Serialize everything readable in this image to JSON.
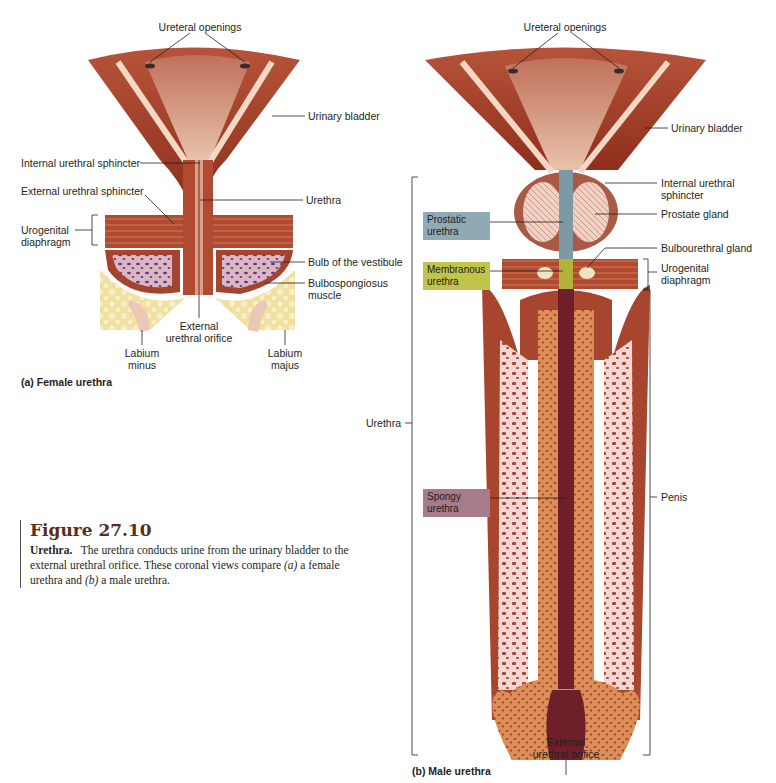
{
  "figure": {
    "number": "Figure 27.10",
    "caption_lead": "Urethra.",
    "caption_text_1": "The urethra conducts urine from the urinary bladder to the external urethral orifice. These coronal views compare ",
    "caption_a": "(a)",
    "caption_text_2": " a female urethra and ",
    "caption_b": "(b)",
    "caption_text_3": " a male urethra."
  },
  "female": {
    "title": "(a) Female urethra",
    "labels": {
      "ureteral_openings": "Ureteral openings",
      "urinary_bladder": "Urinary bladder",
      "internal_sphincter": "Internal urethral sphincter",
      "external_sphincter": "External urethral sphincter",
      "urethra": "Urethra",
      "urogenital_diaphragm_1": "Urogenital",
      "urogenital_diaphragm_2": "diaphragm",
      "bulb_vestibule": "Bulb of the vestibule",
      "bulbospongiosus_1": "Bulbospongiosus",
      "bulbospongiosus_2": "muscle",
      "external_orifice_1": "External",
      "external_orifice_2": "urethral orifice",
      "labium_minus_1": "Labium",
      "labium_minus_2": "minus",
      "labium_majus_1": "Labium",
      "labium_majus_2": "majus"
    }
  },
  "male": {
    "title": "(b) Male urethra",
    "labels": {
      "ureteral_openings": "Ureteral openings",
      "urinary_bladder": "Urinary bladder",
      "internal_sphincter_1": "Internal urethral",
      "internal_sphincter_2": "sphincter",
      "prostate_gland": "Prostate gland",
      "bulbourethral_gland": "Bulbourethral gland",
      "urogenital_diaphragm_1": "Urogenital",
      "urogenital_diaphragm_2": "diaphragm",
      "urethra": "Urethra",
      "penis": "Penis",
      "external_orifice_1": "External",
      "external_orifice_2": "urethral orifice"
    },
    "segments": [
      {
        "line1": "Prostatic",
        "line2": "urethra",
        "color": "#8fa9b5"
      },
      {
        "line1": "Membranous",
        "line2": "urethra",
        "color": "#c2c44a"
      },
      {
        "line1": "Spongy",
        "line2": "urethra",
        "color": "#a77b8a"
      }
    ]
  },
  "colors": {
    "muscle": "#9c3a24",
    "muscle_dark": "#7a2416",
    "mucosa": "#d9a88e",
    "fat": "#f3e3a6",
    "spongy": "#d98a52",
    "lumen": "#6e1f2a",
    "fig_title": "#5a2e1e"
  }
}
